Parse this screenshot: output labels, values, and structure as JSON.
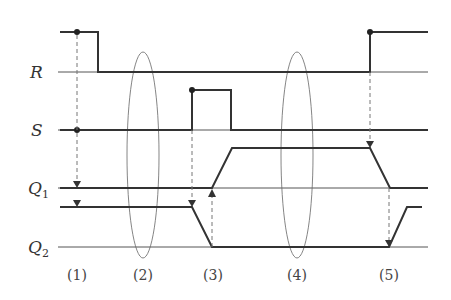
{
  "signals": {
    "r": {
      "label": "R"
    },
    "s": {
      "label": "S"
    },
    "q1": {
      "label": "Q",
      "sub": "1"
    },
    "q2": {
      "label": "Q",
      "sub": "2"
    }
  },
  "phases": [
    "(1)",
    "(2)",
    "(3)",
    "(4)",
    "(5)"
  ],
  "colors": {
    "signal": "#333333",
    "baseline": "#555555",
    "dashed": "#777777",
    "background": "#ffffff"
  }
}
